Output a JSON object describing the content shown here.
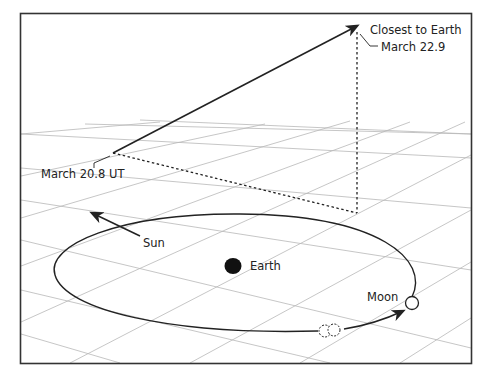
{
  "diagram": {
    "type": "orbital-geometry",
    "labels": {
      "closest": "Closest to Earth",
      "closest_date": "March 22.9",
      "start": "March 20.8 UT",
      "sun": "Sun",
      "earth": "Earth",
      "moon": "Moon"
    },
    "colors": {
      "frame": "#333333",
      "grid": "#b8b8b8",
      "lines": "#222222",
      "earth": "#111111",
      "background": "#ffffff"
    }
  }
}
